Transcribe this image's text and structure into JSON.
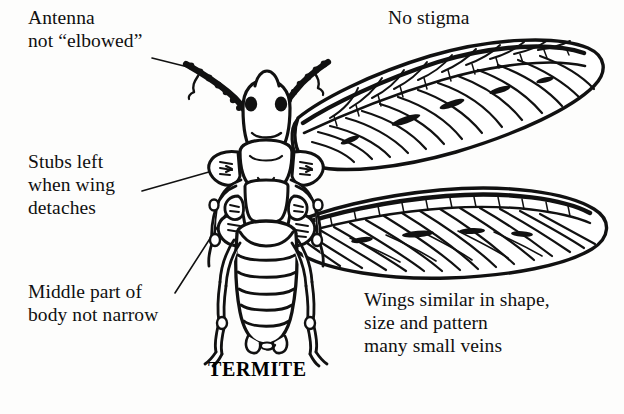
{
  "figure": {
    "caption": "TERMITE",
    "background_color": "#fdfdfc",
    "ink_color": "#101010"
  },
  "labels": {
    "antenna": "Antenna\nnot “elbowed”",
    "stubs": "Stubs left\nwhen wing\ndetaches",
    "middle": "Middle part of\nbody not narrow",
    "no_stigma": "No stigma",
    "wings": "Wings similar in shape,\nsize and pattern\nmany small veins"
  },
  "leader_lines": [
    {
      "name": "antenna-leader",
      "from": [
        152,
        58
      ],
      "to": [
        186,
        66
      ]
    },
    {
      "name": "stubs-leader",
      "from": [
        143,
        190
      ],
      "to": [
        229,
        167
      ]
    },
    {
      "name": "middle-leader",
      "from": [
        176,
        292
      ],
      "to": [
        228,
        210
      ]
    }
  ],
  "anatomy": {
    "parts": [
      "head",
      "eyes",
      "antennae",
      "thorax",
      "wing-stubs",
      "abdomen",
      "legs",
      "forewing",
      "hindwing"
    ],
    "wing_count": 2,
    "leg_count": 6,
    "antenna_count": 2
  }
}
